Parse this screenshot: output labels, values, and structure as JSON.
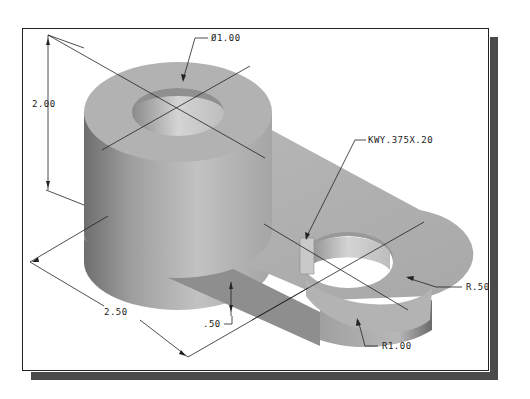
{
  "figure": {
    "type": "isometric shaded CAD part with dimensions",
    "colors": {
      "frame_border": "#222222",
      "shadow": "#4a4a4a",
      "part_light": "#c8c8c8",
      "part_mid": "#a9a9a9",
      "part_dark": "#7a7a7a",
      "dim_line": "#222222"
    }
  },
  "dimensions": {
    "boss_diameter": "Ø1.00",
    "boss_height": "2.00",
    "center_distance": "2.50",
    "plate_thickness": ".50",
    "keyway": "KWY.375X.20",
    "hole_radius": "R.50",
    "end_radius": "R1.00"
  }
}
